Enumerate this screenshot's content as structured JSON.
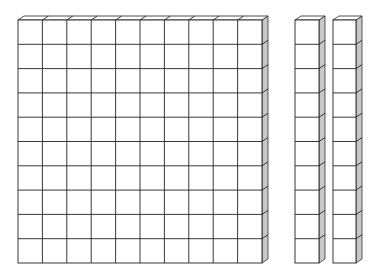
{
  "diagram": {
    "type": "base-ten-blocks",
    "colors": {
      "background": "#ffffff",
      "front_face": "#ffffff",
      "side_face": "#c8c8c8",
      "outline": "#222222"
    },
    "depth": {
      "dx": 6,
      "dy": -4
    },
    "blocks": [
      {
        "name": "hundreds-flat",
        "kind": "flat",
        "x": 18,
        "y": 20,
        "cols": 10,
        "rows": 10,
        "w": 244,
        "h": 243
      },
      {
        "name": "tens-rod-1",
        "kind": "rod",
        "x": 295,
        "y": 20,
        "cols": 1,
        "rows": 10,
        "w": 24,
        "h": 243
      },
      {
        "name": "tens-rod-2",
        "kind": "rod",
        "x": 333,
        "y": 20,
        "cols": 1,
        "rows": 10,
        "w": 23,
        "h": 243
      }
    ],
    "summary": {
      "hundreds": 1,
      "tens": 2,
      "ones": 0,
      "value": 120
    }
  }
}
